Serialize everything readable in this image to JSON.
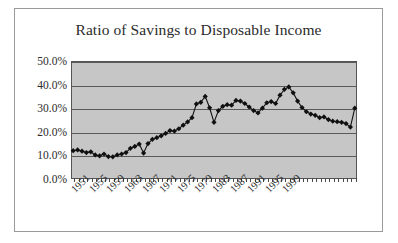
{
  "chart_data": {
    "type": "line",
    "title": "Ratio of Savings to Disposable Income",
    "xlabel": "",
    "ylabel": "",
    "ylim": [
      0,
      50
    ],
    "ytick_labels": [
      "50.0%",
      "40.0%",
      "30.0%",
      "20.0%",
      "10.0%",
      "0.0%"
    ],
    "ytick_values": [
      50,
      40,
      30,
      20,
      10,
      0
    ],
    "grid": true,
    "legend": "none",
    "marker": "diamond",
    "marker_color": "#101010",
    "line_color": "#101010",
    "plot_background": "#c6c6c6",
    "xtick_labels": [
      "1951",
      "1955",
      "1959",
      "1963",
      "1967",
      "1971",
      "1975",
      "1979",
      "1983",
      "1987",
      "1991",
      "1995",
      "1999"
    ],
    "x": [
      1951,
      1952,
      1953,
      1954,
      1955,
      1956,
      1957,
      1958,
      1959,
      1960,
      1961,
      1962,
      1963,
      1964,
      1965,
      1966,
      1967,
      1968,
      1969,
      1970,
      1971,
      1972,
      1973,
      1974,
      1975,
      1976,
      1977,
      1978,
      1979,
      1980,
      1981,
      1982,
      1983,
      1984,
      1985,
      1986,
      1987,
      1988,
      1989,
      1990,
      1991,
      1992,
      1993,
      1994,
      1995,
      1996,
      1997,
      1998,
      1999,
      2000,
      2001,
      2002
    ],
    "values": [
      12.0,
      12.3,
      11.8,
      11.2,
      11.5,
      10.2,
      9.8,
      10.6,
      9.5,
      9.4,
      10.2,
      10.6,
      11.2,
      13.0,
      13.8,
      14.8,
      11.0,
      15.0,
      16.8,
      17.5,
      18.3,
      19.3,
      20.5,
      20.3,
      21.3,
      22.8,
      24.2,
      26.0,
      31.8,
      32.5,
      35.0,
      30.2,
      24.0,
      29.0,
      30.8,
      31.5,
      31.3,
      33.3,
      33.0,
      32.0,
      30.5,
      29.0,
      28.0,
      30.0,
      32.3,
      32.8,
      32.0,
      35.5,
      38.0,
      39.0,
      36.5,
      33.0
    ],
    "values_tail": [
      30.3,
      28.5,
      27.5,
      27.0,
      26.0,
      26.3,
      25.2,
      24.5,
      24.3,
      24.0,
      23.5,
      22.0,
      30.0
    ],
    "units": "percent"
  },
  "frame": {
    "border_color": "#9a9a9a"
  }
}
